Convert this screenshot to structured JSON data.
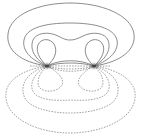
{
  "diagram": {
    "colors": {
      "background": "#ffffff",
      "solid_line": "#6e6e6e",
      "dashed_line": "#8a8a8a",
      "pole": "#444444"
    },
    "poles": [
      {
        "name": "left-pole",
        "x": 47,
        "y": 66
      },
      {
        "name": "right-pole",
        "x": 94,
        "y": 66
      }
    ],
    "upper_contours": [
      {
        "name": "outer",
        "d": "M47,66 C20,62 6,50 8,34 C10,14 40,3 70,3 C100,3 131,14 134,34 C136,50 121,62 94,66"
      },
      {
        "name": "second",
        "d": "M47,66 C30,60 22,50 24,40 C26,28 45,23 70,23 C95,23 114,28 117,40 C119,50 111,60 94,66"
      },
      {
        "name": "third",
        "d": "M47,66 C33,58 30,48 33,40 C36,33 48,31 58,36 C64,39 66,40 70,40 C74,40 77,39 83,36 C93,31 105,33 108,40 C111,48 108,58 94,66"
      },
      {
        "name": "left-loop",
        "d": "M47,66 C38,58 36,50 38,45 C41,38 50,38 54,44 C58,51 55,59 47,66"
      },
      {
        "name": "right-loop",
        "d": "M94,66 C103,58 105,50 103,45 C100,38 91,38 87,44 C83,51 86,59 94,66"
      },
      {
        "name": "inner-bridge-1",
        "d": "M47,66 C60,59 81,59 94,66"
      },
      {
        "name": "inner-bridge-2",
        "d": "M47,66 C60,62 81,62 94,66"
      }
    ],
    "lower_contours": [
      {
        "name": "outer",
        "d": "M47,66 C20,70 4,82 6,98 C8,120 40,133 70,133 C100,133 133,120 135,98 C137,82 121,70 94,66"
      },
      {
        "name": "second",
        "d": "M47,66 C27,72 20,84 24,96 C28,108 50,113 70,113 C90,113 113,108 117,96 C121,84 114,72 94,66"
      },
      {
        "name": "third",
        "d": "M47,66 C32,74 29,86 34,93 C40,100 55,101 70,100 C85,101 101,100 107,93 C112,86 109,74 94,66"
      },
      {
        "name": "left-loop",
        "d": "M47,66 C38,74 36,84 40,88 C45,93 58,92 62,85 C65,79 57,71 47,66"
      },
      {
        "name": "right-loop",
        "d": "M94,66 C103,74 105,84 101,88 C96,93 83,92 79,85 C76,79 84,71 94,66"
      },
      {
        "name": "inner-bridge-1",
        "d": "M47,66 C60,73 81,73 94,66"
      },
      {
        "name": "inner-bridge-2",
        "d": "M47,66 C60,70 81,70 94,66"
      },
      {
        "name": "axis-line",
        "d": "M30,66 L111,66"
      }
    ]
  }
}
